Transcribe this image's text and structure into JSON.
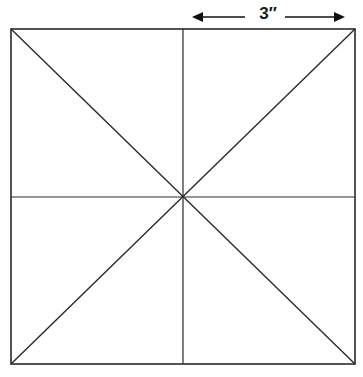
{
  "diagram": {
    "type": "square-with-diagonals-and-midlines",
    "dimension_label": "3″",
    "dimension_span": "half-width of square (center to right edge)",
    "square": {
      "left": 11,
      "top": 29,
      "right": 355,
      "bottom": 364
    },
    "center": {
      "x": 183,
      "y": 197
    },
    "lines": [
      "diagonal-top-left-to-bottom-right",
      "diagonal-top-right-to-bottom-left",
      "vertical-midline",
      "horizontal-midline"
    ],
    "line_color": "#2a2a2a",
    "arrow_color": "#111111"
  }
}
